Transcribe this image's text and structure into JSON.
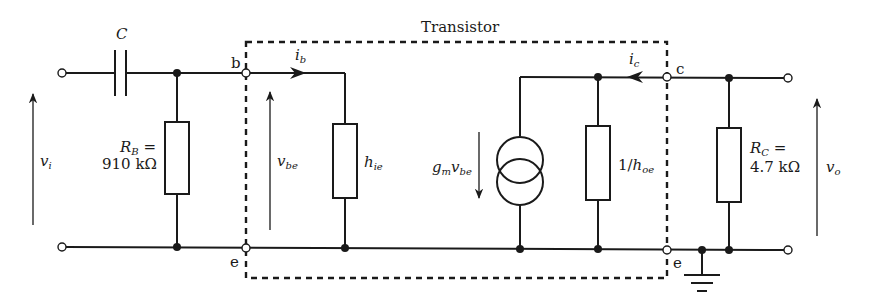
{
  "title": "Transistor",
  "components": {
    "capacitor": {
      "label": "C"
    },
    "rb": {
      "symbol": "R",
      "sub": "B",
      "eq": "=",
      "value": "910 kΩ"
    },
    "hie": {
      "symbol": "h",
      "sub": "ie"
    },
    "current_source": {
      "symbol": "g",
      "sub1": "m",
      "mid": "v",
      "sub2": "be"
    },
    "hoe": {
      "prefix": "1/",
      "symbol": "h",
      "sub": "oe"
    },
    "rc": {
      "symbol": "R",
      "sub": "C",
      "eq": "=",
      "value": "4.7 kΩ"
    }
  },
  "terminals": {
    "base": "b",
    "collector": "c",
    "emitter_left": "e",
    "emitter_right": "e"
  },
  "currents": {
    "ib": {
      "symbol": "i",
      "sub": "b"
    },
    "ic": {
      "symbol": "i",
      "sub": "c"
    }
  },
  "voltages": {
    "vi": {
      "symbol": "v",
      "sub": "i"
    },
    "vbe": {
      "symbol": "v",
      "sub": "be"
    },
    "vo": {
      "symbol": "v",
      "sub": "o"
    }
  },
  "colors": {
    "line": "#1a1a1a",
    "background": "#ffffff"
  }
}
